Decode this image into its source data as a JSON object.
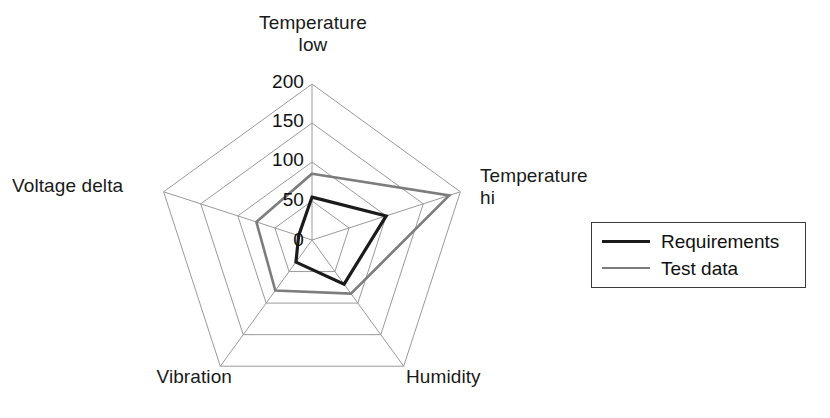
{
  "chart_data": {
    "type": "radar",
    "title": "",
    "categories": [
      "Temperature low",
      "Temperature hi",
      "Humidity",
      "Vibration",
      "Voltage delta"
    ],
    "category_labels_display": [
      "Temperature\nlow",
      "Temperature\nhi",
      "Humidity",
      "Vibration",
      "Voltage delta"
    ],
    "series": [
      {
        "name": "Requirements",
        "color": "#1b1b1b",
        "line_width": 3.2,
        "values": [
          55,
          100,
          70,
          35,
          18
        ]
      },
      {
        "name": "Test data",
        "color": "#7d7d7d",
        "line_width": 2.6,
        "values": [
          85,
          185,
          85,
          80,
          75
        ]
      }
    ],
    "tick_values": [
      0,
      50,
      100,
      150,
      200
    ],
    "tick_labels": [
      "0",
      "50",
      "100",
      "150",
      "200"
    ],
    "rlim": [
      0,
      200
    ],
    "grid": true,
    "grid_color": "#9a9a9a",
    "legend_position": "right",
    "legend_entries": [
      "Requirements",
      "Test data"
    ],
    "xlabel": "",
    "ylabel": ""
  },
  "axis_labels": {
    "temperature_low": "Temperature\nlow",
    "temperature_hi": "Temperature\nhi",
    "humidity": "Humidity",
    "vibration": "Vibration",
    "voltage_delta": "Voltage delta"
  },
  "ticks": {
    "t0": "0",
    "t50": "50",
    "t100": "100",
    "t150": "150",
    "t200": "200"
  },
  "legend": {
    "requirements_label": "Requirements",
    "test_data_label": "Test data"
  }
}
